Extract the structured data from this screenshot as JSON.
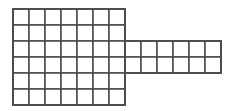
{
  "figure": {
    "background_color": "#ffffff",
    "line_color": "#4a4a4a",
    "line_width": 1.5,
    "cell_fill": "#ffffff",
    "cell_size": 16,
    "total_cells": 54,
    "blocks": [
      {
        "name": "left-block",
        "origin_x": 13,
        "origin_y": 9,
        "columns": 7,
        "rows": 6,
        "cells": 42
      },
      {
        "name": "right-extension",
        "origin_x": 125,
        "origin_y": 41,
        "columns": 6,
        "rows": 2,
        "cells": 12
      }
    ],
    "bounds": {
      "left": 13,
      "top": 9,
      "right": 221,
      "bottom": 105
    }
  }
}
